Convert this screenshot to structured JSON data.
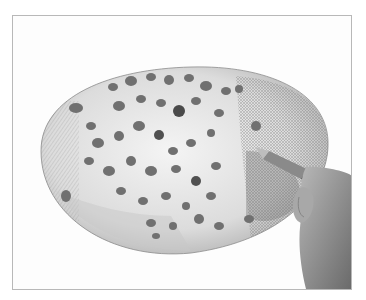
{
  "image": {
    "description": "Pencil drawing of a spotted oval mushroom cap being shaded with a pencil held by a hand",
    "background_color": "#ffffff",
    "frame_color": "#b8b8b8",
    "cap_color": "#d9d9d9",
    "spot_color": "#6e6e6e",
    "skin_color": "#9a9a9a"
  }
}
